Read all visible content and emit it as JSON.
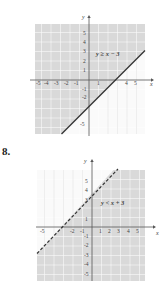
{
  "problems": [
    {
      "number": "",
      "inequality": "y ≥ x − 3",
      "boundary": "solid",
      "shade": "above",
      "x_ticks": [
        "-5",
        "-4",
        "-3",
        "-2",
        "-1",
        "1",
        "4",
        "5"
      ],
      "y_ticks": [
        "5",
        "4",
        "3",
        "2",
        "1",
        "-1",
        "-2",
        "-5"
      ],
      "x_label": "x",
      "y_label": "y"
    },
    {
      "number": "8.",
      "inequality": "y < x + 3",
      "boundary": "dashed",
      "shade": "below",
      "x_ticks": [
        "-5",
        "-2",
        "-1",
        "1",
        "2",
        "3",
        "4",
        "5"
      ],
      "y_ticks": [
        "5",
        "4",
        "3",
        "1",
        "-1",
        "-2",
        "-3",
        "-4",
        "-5"
      ],
      "x_label": "x",
      "y_label": "y"
    }
  ],
  "colors": {
    "shade": "#d9d9d9",
    "grid": "#ffffff",
    "axis": "#555555",
    "line": "#333333",
    "unshaded_grid": "#e6e6e6"
  }
}
